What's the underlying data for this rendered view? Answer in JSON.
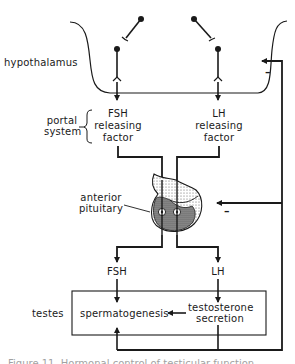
{
  "diagram": {
    "regions": {
      "hypothalamus": "hypothalamus",
      "portal_system": [
        "portal",
        "system"
      ],
      "anterior_pituitary": [
        "anterior",
        "pituitary"
      ],
      "testes": "testes"
    },
    "releasing_factors": {
      "fsh": [
        "FSH",
        "releasing",
        "factor"
      ],
      "lh": [
        "LH",
        "releasing",
        "factor"
      ]
    },
    "hormones": {
      "fsh": "FSH",
      "lh": "LH"
    },
    "testes_processes": {
      "spermatogenesis": "spermatogenesis",
      "testosterone": [
        "testosterone",
        "secretion"
      ]
    },
    "feedback": {
      "hypothalamus_sign": "–",
      "pituitary_sign": "–"
    },
    "caption": "Figure 11. Hormonal control of testicular function"
  }
}
